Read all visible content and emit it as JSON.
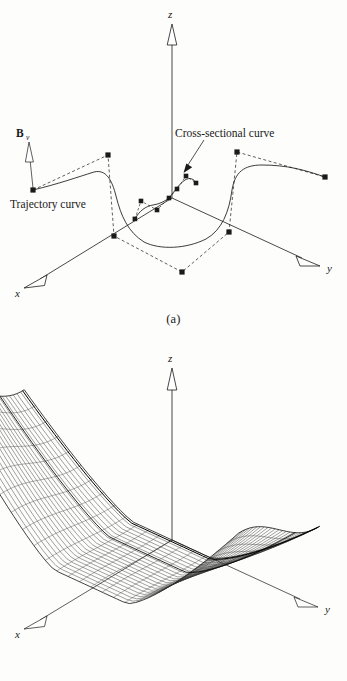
{
  "figure": {
    "background_color": "#fdfdfc",
    "ink_color": "#1a1a1a"
  },
  "panels": [
    {
      "id": "a",
      "caption": "(a)",
      "axes": {
        "z_label": "z",
        "x_label": "x",
        "y_label": "y",
        "arrowhead_style": "hollow-outline"
      },
      "annotations": [
        {
          "name": "trajectory-curve-label",
          "text": "Trajectory curve"
        },
        {
          "name": "cross-sectional-curve-label",
          "text": "Cross-sectional curve"
        },
        {
          "name": "boundary-vector-label",
          "text": "B",
          "subscript": "v"
        }
      ],
      "geometry_notes": {
        "trajectory_curve": "B-spline curve with dashed control polygon and square control points",
        "cross_sectional_curves": "two small B-spline curves near origin with dashed control polygons"
      }
    },
    {
      "id": "b",
      "caption": "(b)",
      "axes": {
        "z_label": "z",
        "x_label": "x",
        "y_label": "y",
        "arrowhead_style": "hollow-outline"
      },
      "geometry_notes": {
        "surface": "swept surface wireframe, valley/saddle shape with ~22 ruling lines"
      }
    }
  ],
  "chart_data": {
    "type": "line",
    "title": "",
    "xlabel": "x",
    "ylabel": "y",
    "panel_a": {
      "trajectory_control_points": [
        [
          33,
          190
        ],
        [
          108,
          155
        ],
        [
          114,
          236
        ],
        [
          182,
          272
        ],
        [
          229,
          232
        ],
        [
          237,
          152
        ],
        [
          325,
          177
        ]
      ],
      "trajectory_curve_sampled": [
        [
          33,
          190
        ],
        [
          60,
          183
        ],
        [
          82,
          176
        ],
        [
          97,
          172
        ],
        [
          108,
          175
        ],
        [
          114,
          188
        ],
        [
          119,
          205
        ],
        [
          126,
          222
        ],
        [
          138,
          237
        ],
        [
          155,
          245
        ],
        [
          175,
          247
        ],
        [
          195,
          243
        ],
        [
          212,
          233
        ],
        [
          223,
          218
        ],
        [
          229,
          200
        ],
        [
          233,
          182
        ],
        [
          240,
          171
        ],
        [
          253,
          166
        ],
        [
          272,
          167
        ],
        [
          296,
          172
        ],
        [
          325,
          177
        ]
      ],
      "cross_section_left": {
        "control_points": [
          [
            135,
            219
          ],
          [
            140,
            201
          ],
          [
            156,
            209
          ],
          [
            168,
            198
          ]
        ],
        "curve": [
          [
            135,
            219
          ],
          [
            143,
            210
          ],
          [
            150,
            206
          ],
          [
            157,
            205
          ],
          [
            163,
            202
          ],
          [
            168,
            198
          ]
        ]
      },
      "cross_section_right": {
        "control_points": [
          [
            168,
            198
          ],
          [
            175,
            190
          ],
          [
            185,
            178
          ],
          [
            194,
            182
          ]
        ],
        "curve": [
          [
            168,
            198
          ],
          [
            174,
            192
          ],
          [
            180,
            184
          ],
          [
            186,
            180
          ],
          [
            191,
            180
          ],
          [
            194,
            182
          ]
        ]
      },
      "axis_origin": [
        172,
        198
      ],
      "z_axis_tip": [
        172,
        25
      ],
      "x_axis_tip": [
        22,
        285
      ],
      "y_axis_tip": [
        320,
        265
      ]
    },
    "panel_b": {
      "axis_origin": [
        172,
        540
      ],
      "z_axis_tip": [
        172,
        368
      ],
      "x_axis_tip": [
        22,
        630
      ],
      "y_axis_tip": [
        318,
        600
      ],
      "ruling_line_count": 22,
      "surface_profile": "valley with two raised wings"
    }
  }
}
